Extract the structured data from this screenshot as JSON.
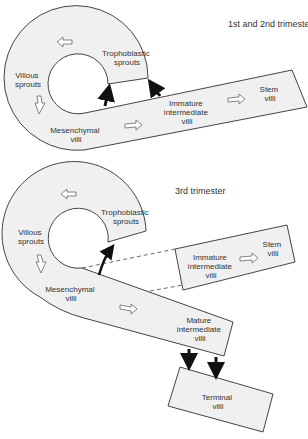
{
  "diagram": {
    "top": {
      "title": "1st and 2nd trimester",
      "labels": {
        "trophoblastic": [
          "Trophoblastic",
          "sprouts"
        ],
        "villous": [
          "Villous",
          "sprouts"
        ],
        "mesenchymal": [
          "Mesenchymal",
          "villi"
        ],
        "immature": [
          "Immature",
          "intermediate",
          "villi"
        ],
        "stem": [
          "Stem",
          "villi"
        ]
      }
    },
    "bottom": {
      "title": "3rd trimester",
      "labels": {
        "trophoblastic": [
          "Trophoblastic",
          "sprouts"
        ],
        "villous": [
          "Villous",
          "sprouts"
        ],
        "mesenchymal": [
          "Mesenchymal",
          "villi"
        ],
        "immature": [
          "Immature",
          "intermediate",
          "villi"
        ],
        "stem": [
          "Stem",
          "villi"
        ],
        "mature": [
          "Mature",
          "intermediate",
          "villi"
        ],
        "terminal": [
          "Terminal",
          "villi"
        ]
      }
    },
    "colors": {
      "fill": "#f0f0f0",
      "stroke": "#444444",
      "arrow": "#111111"
    }
  }
}
